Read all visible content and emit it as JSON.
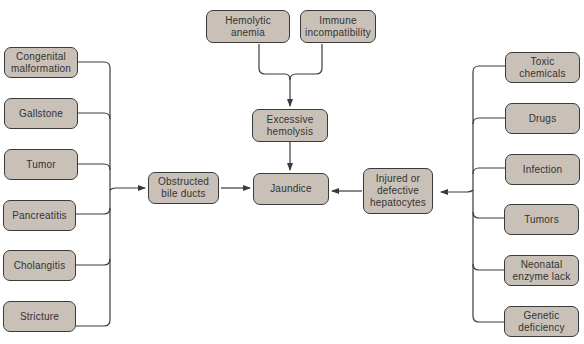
{
  "diagram": {
    "center": "Jaundice",
    "top": {
      "sources": [
        "Hemolytic\nanemia",
        "Immune\nincompatibility"
      ],
      "intermediate": "Excessive\nhemolysis"
    },
    "left": {
      "intermediate": "Obstructed\nbile ducts",
      "causes": [
        "Congenital\nmalformation",
        "Gallstone",
        "Tumor",
        "Pancreatitis",
        "Cholangitis",
        "Stricture"
      ]
    },
    "right": {
      "intermediate": "Injured or\ndefective\nhepatocytes",
      "causes": [
        "Toxic\nchemicals",
        "Drugs",
        "Infection",
        "Tumors",
        "Neonatal\nenzyme lack",
        "Genetic\ndeficiency"
      ]
    },
    "colors": {
      "node_fill": "#c9c0b8",
      "node_border": "#3a3a3a",
      "line": "#3a3a3a"
    }
  }
}
